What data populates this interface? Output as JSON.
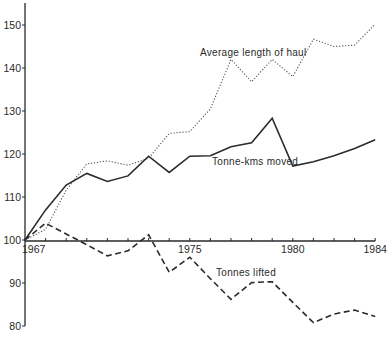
{
  "chart_data": {
    "type": "line",
    "title": "",
    "xlabel": "",
    "ylabel": "",
    "index_base": "1967 = 100",
    "x": [
      1967,
      1968,
      1969,
      1970,
      1971,
      1972,
      1973,
      1974,
      1975,
      1976,
      1977,
      1978,
      1979,
      1980,
      1981,
      1982,
      1983,
      1984
    ],
    "xlim": [
      1967,
      1984
    ],
    "ylim": [
      80,
      155
    ],
    "grid": false,
    "legend_position": "inline labels",
    "x_tick_labels": [
      {
        "year": 1967,
        "label": "1967"
      },
      {
        "year": 1975,
        "label": "1975"
      },
      {
        "year": 1980,
        "label": "1980"
      },
      {
        "year": 1984,
        "label": "1984"
      }
    ],
    "y_tick_labels": [
      {
        "value": 80,
        "label": "80"
      },
      {
        "value": 90,
        "label": "90"
      },
      {
        "value": 100,
        "label": "100"
      },
      {
        "value": 110,
        "label": "110"
      },
      {
        "value": 120,
        "label": "120"
      },
      {
        "value": 130,
        "label": "130"
      },
      {
        "value": 140,
        "label": "140"
      },
      {
        "value": 150,
        "label": "150"
      }
    ],
    "series": [
      {
        "name": "Average length of haul",
        "style": "dotted",
        "values": [
          100,
          102.5,
          111.6,
          117.7,
          118.4,
          117.4,
          119,
          124.8,
          125.2,
          130.5,
          142,
          136.8,
          142,
          138,
          146.7,
          145,
          145.3,
          150.2
        ],
        "label_pos": {
          "x": 200,
          "y": 56
        }
      },
      {
        "name": "Tonne-kms moved",
        "style": "solid",
        "values": [
          100,
          107,
          112.8,
          115.5,
          113.6,
          114.9,
          119.5,
          115.7,
          119.5,
          119.6,
          121.7,
          122.6,
          128.3,
          117.2,
          118.2,
          119.6,
          121.3,
          123.3
        ],
        "label_pos": {
          "x": 212,
          "y": 165
        }
      },
      {
        "name": "Tonnes lifted",
        "style": "dashed",
        "values": [
          100,
          103.9,
          101.4,
          98.9,
          96.3,
          97.5,
          101.2,
          92.5,
          96,
          91,
          86.2,
          90.1,
          90.3,
          85.5,
          80.8,
          82.8,
          83.7,
          82.2
        ],
        "label_pos": {
          "x": 216,
          "y": 276
        }
      }
    ]
  }
}
